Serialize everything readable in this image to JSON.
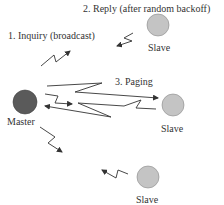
{
  "diagram": {
    "title": "",
    "nodes": {
      "master": {
        "label": "Master",
        "role": "master",
        "color": "#5a5a5a"
      },
      "slave_top": {
        "label": "Slave",
        "role": "slave",
        "color": "#c4c4c4"
      },
      "slave_middle": {
        "label": "Slave",
        "role": "slave",
        "color": "#c4c4c4"
      },
      "slave_bottom": {
        "label": "Slave",
        "role": "slave",
        "color": "#c4c4c4"
      }
    },
    "steps": [
      {
        "label": "1. Inquiry (broadcast)",
        "from": "Master",
        "to": "broadcast"
      },
      {
        "label": "2. Reply (after random backoff)",
        "from": "Slave",
        "to": "Master"
      },
      {
        "label": "3. Paging",
        "from": "Master",
        "to": "Slave"
      }
    ],
    "colors": {
      "line": "#333333",
      "text": "#333333"
    }
  }
}
